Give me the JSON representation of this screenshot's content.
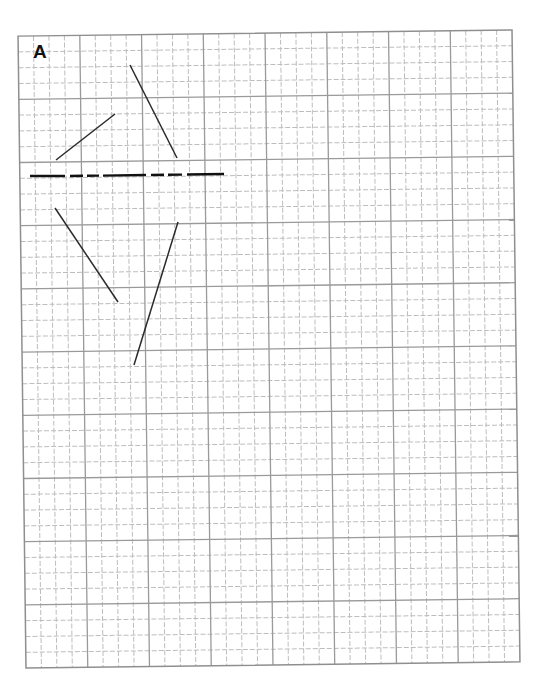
{
  "figure": {
    "label": "A",
    "background": "#ffffff"
  },
  "grid": {
    "origin": [
      22,
      33
    ],
    "width": 494,
    "height": 632,
    "rotation_deg": -0.72,
    "major_cols": 8,
    "major_rows": 10,
    "minor_per_major": 4,
    "major_color": "#9a9a9a",
    "minor_color": "#bdbdbd",
    "border_color": "#8f8f8f"
  },
  "drawing": {
    "stroke_color": "#2a2a2a",
    "segments": [
      {
        "name": "upper-left-diagonal",
        "x1": 56,
        "y1": 160,
        "x2": 115,
        "y2": 114
      },
      {
        "name": "upper-right-diagonal",
        "x1": 130,
        "y1": 65,
        "x2": 177,
        "y2": 158
      },
      {
        "name": "lower-left-diagonal",
        "x1": 55,
        "y1": 208,
        "x2": 118,
        "y2": 302
      },
      {
        "name": "lower-right-diagonal",
        "x1": 178,
        "y1": 222,
        "x2": 134,
        "y2": 365
      }
    ],
    "dashed_axis": {
      "name": "horizontal-dashed-axis",
      "dashes": [
        {
          "x1": 30,
          "y1": 176,
          "x2": 65,
          "y2": 176
        },
        {
          "x1": 70,
          "y1": 176,
          "x2": 83,
          "y2": 175.8
        },
        {
          "x1": 87,
          "y1": 175.8,
          "x2": 99,
          "y2": 175.6
        },
        {
          "x1": 103,
          "y1": 175.6,
          "x2": 146,
          "y2": 175
        },
        {
          "x1": 151,
          "y1": 175,
          "x2": 164,
          "y2": 174.8
        },
        {
          "x1": 168,
          "y1": 174.8,
          "x2": 182,
          "y2": 174.6
        },
        {
          "x1": 187,
          "y1": 174.5,
          "x2": 224,
          "y2": 174
        }
      ]
    }
  }
}
